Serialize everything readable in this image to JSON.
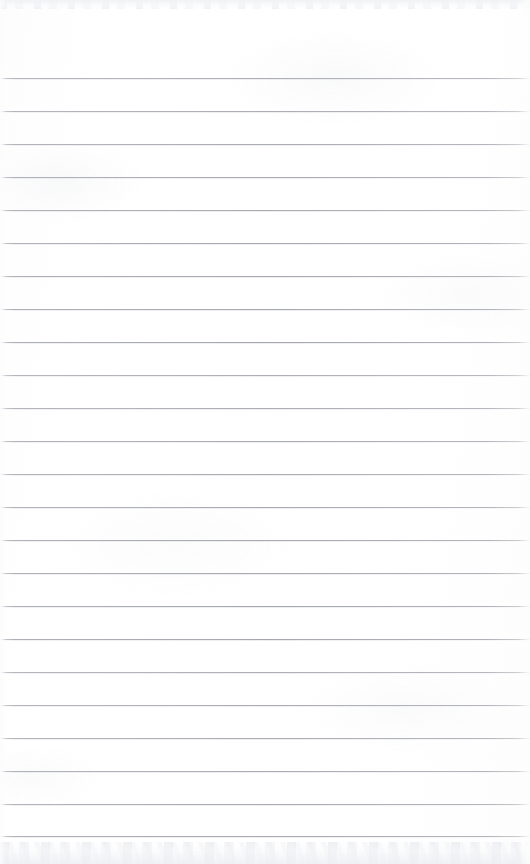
{
  "document": {
    "type": "blank-lined-paper-scan",
    "title": "",
    "text_content": "",
    "body_text": "",
    "page_number": "",
    "header_text": "",
    "footer_text": ""
  },
  "page": {
    "width": 530,
    "height": 864,
    "background_color": "#ffffff",
    "paper_tone": "#fdfdfe"
  },
  "ruling": {
    "line_color": "#a3a5ac",
    "line_thickness": 1,
    "line_count": 24,
    "first_line_y": 78,
    "line_spacing": 32.9,
    "left_inset": 0,
    "right_inset": 0,
    "margin_rule": "none",
    "line_y_positions": [
      78,
      111,
      144,
      177,
      210,
      243,
      276,
      309,
      342,
      375,
      408,
      441,
      474,
      507,
      540,
      573,
      606,
      639,
      672,
      705,
      738,
      771,
      804,
      836
    ]
  },
  "scan_artifacts": {
    "top_band_height": 9,
    "bottom_band_height": 22,
    "edge_noise_color": "#e6e8ec",
    "mottle_color": "#e8eaee"
  }
}
